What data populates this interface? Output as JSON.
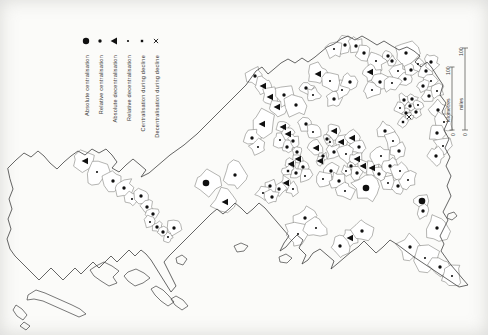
{
  "figure": {
    "background": "#fbfbf9",
    "ink": "#101010",
    "line": "#3f3f3f"
  },
  "legend": {
    "items": [
      {
        "label": "Absolute centralisation",
        "symbol": "large-filled-circle"
      },
      {
        "label": "Relative centralisation",
        "symbol": "small-filled-circle"
      },
      {
        "label": "Absolute decentralisation",
        "symbol": "filled-triangle"
      },
      {
        "label": "Relative decentralisation",
        "symbol": "small-dot"
      },
      {
        "label": "Centralisation during decline",
        "symbol": "small-square"
      },
      {
        "label": "Decentralisation during decline",
        "symbol": "x-mark"
      }
    ]
  },
  "scalebar": {
    "miles": {
      "label": "miles",
      "start": "0",
      "end": "100"
    },
    "kilometres": {
      "label": "kilometres",
      "start": "0",
      "end": "100"
    }
  },
  "map": {
    "marker_types": {
      "ac": "absolute-centralisation",
      "rc": "relative-centralisation",
      "ad": "absolute-decentralisation",
      "rd": "relative-decentralisation",
      "cd": "centralisation-during-decline",
      "dd": "decentralisation-during-decline"
    },
    "markers": [
      {
        "x": 85,
        "y": 161,
        "t": "ad"
      },
      {
        "x": 97,
        "y": 172,
        "t": "rd"
      },
      {
        "x": 113,
        "y": 181,
        "t": "rc"
      },
      {
        "x": 124,
        "y": 188,
        "t": "rc"
      },
      {
        "x": 132,
        "y": 199,
        "t": "rd"
      },
      {
        "x": 141,
        "y": 196,
        "t": "rc"
      },
      {
        "x": 147,
        "y": 207,
        "t": "rc"
      },
      {
        "x": 153,
        "y": 214,
        "t": "rc"
      },
      {
        "x": 150,
        "y": 222,
        "t": "rd"
      },
      {
        "x": 157,
        "y": 227,
        "t": "rc"
      },
      {
        "x": 163,
        "y": 232,
        "t": "rc"
      },
      {
        "x": 168,
        "y": 237,
        "t": "rd"
      },
      {
        "x": 174,
        "y": 228,
        "t": "rc"
      },
      {
        "x": 206,
        "y": 183,
        "t": "ac"
      },
      {
        "x": 225,
        "y": 202,
        "t": "ad"
      },
      {
        "x": 235,
        "y": 175,
        "t": "rc"
      },
      {
        "x": 255,
        "y": 76,
        "t": "rc"
      },
      {
        "x": 263,
        "y": 86,
        "t": "ad"
      },
      {
        "x": 270,
        "y": 97,
        "t": "ad"
      },
      {
        "x": 277,
        "y": 107,
        "t": "ad"
      },
      {
        "x": 284,
        "y": 95,
        "t": "rc"
      },
      {
        "x": 262,
        "y": 124,
        "t": "ad"
      },
      {
        "x": 252,
        "y": 138,
        "t": "rc"
      },
      {
        "x": 258,
        "y": 147,
        "t": "rd"
      },
      {
        "x": 318,
        "y": 74,
        "t": "ad"
      },
      {
        "x": 306,
        "y": 88,
        "t": "rc"
      },
      {
        "x": 296,
        "y": 105,
        "t": "rc"
      },
      {
        "x": 313,
        "y": 95,
        "t": "rd"
      },
      {
        "x": 306,
        "y": 124,
        "t": "rc"
      },
      {
        "x": 313,
        "y": 132,
        "t": "rd"
      },
      {
        "x": 283,
        "y": 127,
        "t": "ad"
      },
      {
        "x": 288,
        "y": 134,
        "t": "ad"
      },
      {
        "x": 293,
        "y": 141,
        "t": "rc"
      },
      {
        "x": 287,
        "y": 147,
        "t": "rc"
      },
      {
        "x": 280,
        "y": 140,
        "t": "rd"
      },
      {
        "x": 297,
        "y": 152,
        "t": "rc"
      },
      {
        "x": 316,
        "y": 148,
        "t": "ad"
      },
      {
        "x": 323,
        "y": 156,
        "t": "rc"
      },
      {
        "x": 330,
        "y": 142,
        "t": "rd"
      },
      {
        "x": 298,
        "y": 159,
        "t": "ad"
      },
      {
        "x": 291,
        "y": 164,
        "t": "ad"
      },
      {
        "x": 303,
        "y": 167,
        "t": "rc"
      },
      {
        "x": 296,
        "y": 173,
        "t": "rc"
      },
      {
        "x": 288,
        "y": 171,
        "t": "cd"
      },
      {
        "x": 305,
        "y": 176,
        "t": "rd"
      },
      {
        "x": 286,
        "y": 183,
        "t": "ad"
      },
      {
        "x": 279,
        "y": 189,
        "t": "rc"
      },
      {
        "x": 293,
        "y": 189,
        "t": "rd"
      },
      {
        "x": 270,
        "y": 186,
        "t": "rc"
      },
      {
        "x": 263,
        "y": 193,
        "t": "rd"
      },
      {
        "x": 272,
        "y": 197,
        "t": "rc"
      },
      {
        "x": 334,
        "y": 99,
        "t": "rc"
      },
      {
        "x": 342,
        "y": 90,
        "t": "rd"
      },
      {
        "x": 350,
        "y": 82,
        "t": "rc"
      },
      {
        "x": 330,
        "y": 81,
        "t": "rd"
      },
      {
        "x": 334,
        "y": 131,
        "t": "ad"
      },
      {
        "x": 327,
        "y": 139,
        "t": "rc"
      },
      {
        "x": 341,
        "y": 142,
        "t": "ad"
      },
      {
        "x": 320,
        "y": 161,
        "t": "ad"
      },
      {
        "x": 334,
        "y": 152,
        "t": "rc"
      },
      {
        "x": 352,
        "y": 138,
        "t": "ad"
      },
      {
        "x": 359,
        "y": 147,
        "t": "rc"
      },
      {
        "x": 346,
        "y": 154,
        "t": "rd"
      },
      {
        "x": 345,
        "y": 45,
        "t": "rc"
      },
      {
        "x": 334,
        "y": 49,
        "t": "rd"
      },
      {
        "x": 356,
        "y": 46,
        "t": "rc"
      },
      {
        "x": 364,
        "y": 53,
        "t": "rc"
      },
      {
        "x": 376,
        "y": 61,
        "t": "rd"
      },
      {
        "x": 388,
        "y": 56,
        "t": "rc"
      },
      {
        "x": 406,
        "y": 53,
        "t": "rc"
      },
      {
        "x": 370,
        "y": 72,
        "t": "ad"
      },
      {
        "x": 380,
        "y": 82,
        "t": "rc"
      },
      {
        "x": 372,
        "y": 90,
        "t": "rd"
      },
      {
        "x": 357,
        "y": 159,
        "t": "ad"
      },
      {
        "x": 363,
        "y": 166,
        "t": "ad"
      },
      {
        "x": 351,
        "y": 166,
        "t": "rc"
      },
      {
        "x": 357,
        "y": 173,
        "t": "rc"
      },
      {
        "x": 346,
        "y": 171,
        "t": "rd"
      },
      {
        "x": 372,
        "y": 168,
        "t": "ad"
      },
      {
        "x": 331,
        "y": 171,
        "t": "rc"
      },
      {
        "x": 323,
        "y": 179,
        "t": "rd"
      },
      {
        "x": 339,
        "y": 181,
        "t": "rc"
      },
      {
        "x": 345,
        "y": 191,
        "t": "rd"
      },
      {
        "x": 305,
        "y": 218,
        "t": "rc"
      },
      {
        "x": 298,
        "y": 234,
        "t": "rd"
      },
      {
        "x": 350,
        "y": 238,
        "t": "ad"
      },
      {
        "x": 340,
        "y": 246,
        "t": "rc"
      },
      {
        "x": 362,
        "y": 231,
        "t": "rc"
      },
      {
        "x": 316,
        "y": 228,
        "t": "rd"
      },
      {
        "x": 366,
        "y": 188,
        "t": "ac"
      },
      {
        "x": 422,
        "y": 201,
        "t": "ac"
      },
      {
        "x": 385,
        "y": 131,
        "t": "rc"
      },
      {
        "x": 393,
        "y": 141,
        "t": "rd"
      },
      {
        "x": 399,
        "y": 151,
        "t": "rc"
      },
      {
        "x": 381,
        "y": 156,
        "t": "rd"
      },
      {
        "x": 390,
        "y": 166,
        "t": "rc"
      },
      {
        "x": 400,
        "y": 171,
        "t": "rd"
      },
      {
        "x": 379,
        "y": 174,
        "t": "rc"
      },
      {
        "x": 388,
        "y": 183,
        "t": "rd"
      },
      {
        "x": 398,
        "y": 186,
        "t": "rc"
      },
      {
        "x": 408,
        "y": 180,
        "t": "rd"
      },
      {
        "x": 404,
        "y": 100,
        "t": "rc"
      },
      {
        "x": 410,
        "y": 106,
        "t": "rc"
      },
      {
        "x": 416,
        "y": 112,
        "t": "rc"
      },
      {
        "x": 406,
        "y": 113,
        "t": "rc"
      },
      {
        "x": 412,
        "y": 99,
        "t": "rc"
      },
      {
        "x": 400,
        "y": 108,
        "t": "rd"
      },
      {
        "x": 418,
        "y": 105,
        "t": "rd"
      },
      {
        "x": 409,
        "y": 117,
        "t": "dd"
      },
      {
        "x": 403,
        "y": 122,
        "t": "cd"
      },
      {
        "x": 392,
        "y": 61,
        "t": "rc"
      },
      {
        "x": 398,
        "y": 71,
        "t": "rd"
      },
      {
        "x": 405,
        "y": 79,
        "t": "rc"
      },
      {
        "x": 392,
        "y": 83,
        "t": "rd"
      },
      {
        "x": 411,
        "y": 70,
        "t": "rc"
      },
      {
        "x": 418,
        "y": 64,
        "t": "rd"
      },
      {
        "x": 426,
        "y": 71,
        "t": "rc"
      },
      {
        "x": 431,
        "y": 81,
        "t": "rd"
      },
      {
        "x": 423,
        "y": 86,
        "t": "rc"
      },
      {
        "x": 429,
        "y": 96,
        "t": "rc"
      },
      {
        "x": 437,
        "y": 91,
        "t": "rd"
      },
      {
        "x": 431,
        "y": 62,
        "t": "rc"
      },
      {
        "x": 438,
        "y": 110,
        "t": "rc"
      },
      {
        "x": 444,
        "y": 122,
        "t": "rd"
      },
      {
        "x": 437,
        "y": 133,
        "t": "rc"
      },
      {
        "x": 443,
        "y": 146,
        "t": "rd"
      },
      {
        "x": 436,
        "y": 156,
        "t": "rc"
      },
      {
        "x": 423,
        "y": 211,
        "t": "rc"
      },
      {
        "x": 437,
        "y": 228,
        "t": "rc"
      },
      {
        "x": 410,
        "y": 247,
        "t": "rc"
      },
      {
        "x": 425,
        "y": 258,
        "t": "rd"
      },
      {
        "x": 440,
        "y": 267,
        "t": "rc"
      },
      {
        "x": 452,
        "y": 276,
        "t": "rd"
      }
    ]
  }
}
